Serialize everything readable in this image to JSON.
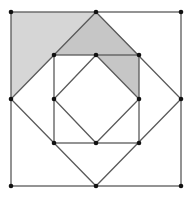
{
  "figure": {
    "colors": {
      "line": "#555555",
      "point": "#111111",
      "shade_light": "#d4d4d4",
      "shade_dark": "#c4c4c4",
      "background": "#ffffff"
    }
  }
}
